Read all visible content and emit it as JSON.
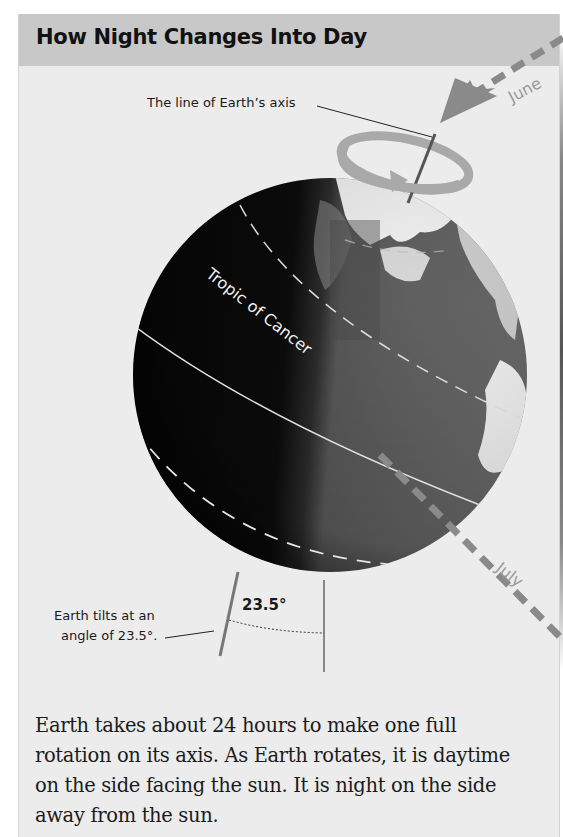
{
  "panel": {
    "title": "How Night Changes Into Day"
  },
  "diagram": {
    "axis_label": "The line of Earth’s axis",
    "tropic_label": "Tropic of Cancer",
    "month_top": "June",
    "month_bottom": "July",
    "tilt_label_line1": "Earth tilts at an",
    "tilt_label_line2": "angle of 23.5°.",
    "angle_value": "23.5°",
    "colors": {
      "header_bg": "#c8c8c8",
      "panel_bg": "#ececec",
      "orbit_gray": "#8a8a8a",
      "globe_night": "#0a0a0a"
    }
  },
  "caption": {
    "text": "Earth takes about 24 hours to make one full rotation on its axis. As Earth rotates, it is daytime on the side facing the sun. It is night on the side away from the sun."
  }
}
